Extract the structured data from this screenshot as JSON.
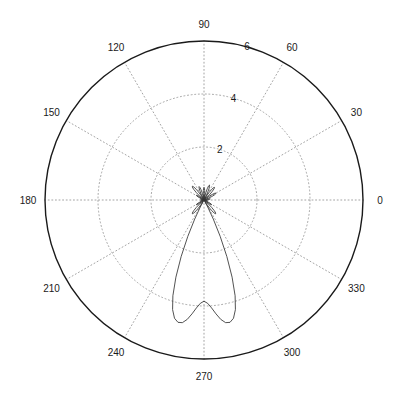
{
  "figure": {
    "title": "",
    "background_color": "#ffffff",
    "axis_color": "#1a1a1a",
    "grid_color": "#9a9a9a",
    "curve_color": "#333333"
  },
  "chart_data": {
    "type": "line",
    "subtype": "polar",
    "title": "",
    "xlabel": "",
    "ylabel": "",
    "grid": true,
    "legend": [],
    "legend_position": "none",
    "angle_unit": "degrees",
    "angular_tick_labels": [
      "0",
      "30",
      "60",
      "90",
      "120",
      "150",
      "180",
      "210",
      "240",
      "270",
      "300",
      "330"
    ],
    "angular_tick_values": [
      0,
      30,
      60,
      90,
      120,
      150,
      180,
      210,
      240,
      270,
      300,
      330
    ],
    "radial_tick_labels": [
      "2",
      "4",
      "6"
    ],
    "radial_tick_values": [
      2,
      4,
      6
    ],
    "rlim": [
      0,
      6
    ],
    "radial_label_angle": 75,
    "series": [
      {
        "name": "radiation pattern",
        "color": "#333333",
        "theta": [
          0,
          2,
          4,
          6,
          8,
          10,
          12,
          14,
          16,
          18,
          20,
          22,
          24,
          26,
          28,
          30,
          32,
          34,
          36,
          38,
          40,
          42,
          44,
          46,
          48,
          50,
          52,
          54,
          56,
          58,
          60,
          62,
          64,
          66,
          68,
          70,
          72,
          74,
          76,
          78,
          80,
          82,
          84,
          86,
          88,
          90,
          92,
          94,
          96,
          98,
          100,
          102,
          104,
          106,
          108,
          110,
          112,
          114,
          116,
          118,
          120,
          122,
          124,
          126,
          128,
          130,
          132,
          134,
          136,
          138,
          140,
          142,
          144,
          146,
          148,
          150,
          152,
          154,
          156,
          158,
          160,
          162,
          164,
          166,
          168,
          170,
          172,
          174,
          176,
          178,
          180,
          182,
          184,
          186,
          188,
          190,
          192,
          194,
          196,
          198,
          200,
          202,
          204,
          206,
          208,
          210,
          212,
          214,
          216,
          218,
          220,
          222,
          224,
          226,
          228,
          230,
          232,
          234,
          236,
          238,
          240,
          242,
          244,
          246,
          248,
          250,
          252,
          254,
          256,
          258,
          260,
          262,
          264,
          266,
          268,
          270,
          272,
          274,
          276,
          278,
          280,
          282,
          284,
          286,
          288,
          290,
          292,
          294,
          296,
          298,
          300,
          302,
          304,
          306,
          308,
          310,
          312,
          314,
          316,
          318,
          320,
          322,
          324,
          326,
          328,
          330,
          332,
          334,
          336,
          338,
          340,
          342,
          344,
          346,
          348,
          350,
          352,
          354,
          356,
          358,
          360
        ],
        "r": [
          0.02,
          0.06,
          0.12,
          0.18,
          0.22,
          0.24,
          0.22,
          0.16,
          0.08,
          0.02,
          0.06,
          0.18,
          0.32,
          0.44,
          0.5,
          0.52,
          0.48,
          0.38,
          0.24,
          0.1,
          0.02,
          0.12,
          0.28,
          0.44,
          0.56,
          0.62,
          0.6,
          0.5,
          0.34,
          0.16,
          0.02,
          0.14,
          0.3,
          0.46,
          0.56,
          0.6,
          0.56,
          0.44,
          0.28,
          0.12,
          0.02,
          0.1,
          0.24,
          0.36,
          0.44,
          0.48,
          0.44,
          0.36,
          0.24,
          0.1,
          0.02,
          0.12,
          0.26,
          0.4,
          0.5,
          0.54,
          0.5,
          0.4,
          0.26,
          0.1,
          0.02,
          0.14,
          0.32,
          0.5,
          0.62,
          0.68,
          0.66,
          0.56,
          0.4,
          0.2,
          0.03,
          0.1,
          0.22,
          0.3,
          0.34,
          0.32,
          0.26,
          0.16,
          0.06,
          0.02,
          0.05,
          0.1,
          0.13,
          0.14,
          0.12,
          0.08,
          0.04,
          0.02,
          0.02,
          0.02,
          0.02,
          0.02,
          0.02,
          0.02,
          0.04,
          0.08,
          0.12,
          0.14,
          0.13,
          0.1,
          0.05,
          0.02,
          0.06,
          0.16,
          0.26,
          0.32,
          0.34,
          0.3,
          0.22,
          0.1,
          0.03,
          0.2,
          0.4,
          0.56,
          0.66,
          0.68,
          0.62,
          0.5,
          0.32,
          0.14,
          0.02,
          0.3,
          0.8,
          1.5,
          2.3,
          3.1,
          3.8,
          4.3,
          4.6,
          4.72,
          4.7,
          4.55,
          4.32,
          4.08,
          3.9,
          3.82,
          3.9,
          4.08,
          4.32,
          4.55,
          4.7,
          4.72,
          4.6,
          4.3,
          3.8,
          3.1,
          2.3,
          1.5,
          0.8,
          0.3,
          0.02,
          0.14,
          0.32,
          0.5,
          0.62,
          0.68,
          0.66,
          0.56,
          0.4,
          0.2,
          0.03,
          0.1,
          0.22,
          0.3,
          0.34,
          0.32,
          0.26,
          0.16,
          0.06,
          0.02,
          0.05,
          0.1,
          0.13,
          0.14,
          0.12,
          0.08,
          0.04,
          0.02,
          0.02,
          0.02,
          0.02
        ]
      }
    ],
    "annotations": []
  },
  "geometry": {
    "center_x": 204,
    "center_y": 200,
    "outer_radius": 159
  }
}
